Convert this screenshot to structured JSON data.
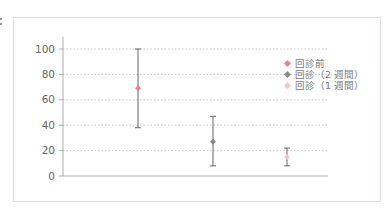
{
  "chart_data": {
    "type": "scatter",
    "subtype": "mean_with_error_bars",
    "title": "",
    "xlabel": "",
    "ylabel": "",
    "ylim": [
      0,
      100
    ],
    "yticks": [
      0,
      20,
      40,
      60,
      80,
      100
    ],
    "grid": {
      "y": true,
      "style": "dotted"
    },
    "legend_position": "upper-right",
    "series": [
      {
        "name": "回診前",
        "color": "#e8828f",
        "mean": 69,
        "lower": 38,
        "upper": 100
      },
      {
        "name": "回診（2 週間）",
        "color": "#8a8a8a",
        "mean": 27,
        "lower": 8,
        "upper": 47
      },
      {
        "name": "回診（1 週間）",
        "color": "#f6c6cf",
        "mean": 15,
        "lower": 8,
        "upper": 22
      }
    ]
  },
  "axis": {
    "tick_labels": [
      "100",
      "80",
      "60",
      "40",
      "20",
      "0"
    ]
  },
  "legend": {
    "items": [
      {
        "label": "回診前",
        "color": "#e8828f"
      },
      {
        "label": "回診（2 週間）",
        "color": "#8a8a8a"
      },
      {
        "label": "回診（1 週間）",
        "color": "#f6c6cf"
      }
    ]
  },
  "colors": {
    "frame_border": "#f3d6dc",
    "axis": "#9a9a9a",
    "grid": "#b8b8b8",
    "error_bar": "#666666"
  }
}
